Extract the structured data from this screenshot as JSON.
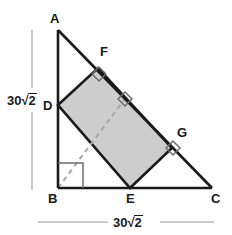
{
  "diagram": {
    "vertices": [
      {
        "name": "A",
        "label": "A",
        "x": 58,
        "y": 30,
        "label_x": 50,
        "label_y": 12
      },
      {
        "name": "B",
        "label": "B",
        "x": 58,
        "y": 188,
        "label_x": 50,
        "label_y": 194
      },
      {
        "name": "C",
        "label": "C",
        "x": 212,
        "y": 188,
        "label_x": 212,
        "label_y": 194
      },
      {
        "name": "D",
        "label": "D",
        "x": 58,
        "y": 105,
        "label_x": 44,
        "label_y": 99
      },
      {
        "name": "E",
        "label": "E",
        "x": 130,
        "y": 188,
        "label_x": 126,
        "label_y": 194
      },
      {
        "name": "F",
        "label": "F",
        "x": 98,
        "y": 68,
        "label_x": 100,
        "label_y": 46
      },
      {
        "name": "G",
        "label": "G",
        "x": 172,
        "y": 148,
        "label_x": 178,
        "label_y": 127
      }
    ],
    "rectangle_fill": "#cdcdcd",
    "stroke_color": "#1a1a1a",
    "dimension_color": "#9a9a9a",
    "dashed_color": "#a8a8a8",
    "dimensions": [
      {
        "name": "vertical-dimension",
        "value": "30",
        "radicand": "2",
        "orientation": "vertical",
        "label_x": 6,
        "label_y": 92
      },
      {
        "name": "horizontal-dimension",
        "value": "30",
        "radicand": "2",
        "orientation": "horizontal",
        "label_x": 112,
        "label_y": 214
      }
    ],
    "right_angle_marks": [
      {
        "name": "right-angle-at-B",
        "at": "B"
      },
      {
        "name": "right-angle-at-F",
        "at": "F"
      },
      {
        "name": "right-angle-at-G",
        "at": "G"
      },
      {
        "name": "right-angle-at-foot",
        "at": "DE-midpoint"
      }
    ],
    "dashed_segment": {
      "from": "B",
      "to_x": 124,
      "to_y": 100
    }
  }
}
